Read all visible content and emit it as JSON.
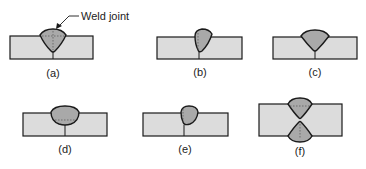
{
  "diagram": {
    "callout": "Weld joint",
    "panels": [
      {
        "id": "a",
        "label": "(a)",
        "type": "single-V groove (dashed multi-pass)"
      },
      {
        "id": "b",
        "label": "(b)",
        "type": "single-bevel groove"
      },
      {
        "id": "c",
        "label": "(c)",
        "type": "single-V groove"
      },
      {
        "id": "d",
        "label": "(d)",
        "type": "single-U groove"
      },
      {
        "id": "e",
        "label": "(e)",
        "type": "single-J groove"
      },
      {
        "id": "f",
        "label": "(f)",
        "type": "double-V groove"
      }
    ],
    "colors": {
      "plate_fill": "#dcdcdc",
      "weld_fill": "#a9a9a9",
      "stroke": "#1a1a1a",
      "text": "#222222"
    }
  }
}
